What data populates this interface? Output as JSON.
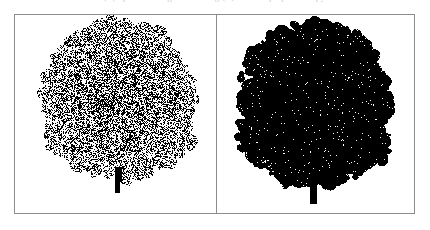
{
  "figure": {
    "caption_remnant": "(a) sparse foliage rendering          (b) dense opaque canopy",
    "frame_color": "#8c8c8c",
    "background_color": "#ffffff",
    "divider_x": 216
  },
  "panels": [
    {
      "id": "panel-left",
      "name": "left-tree-panel",
      "label": "",
      "tree": {
        "style": "halftone-dithered",
        "ink_color": "#000000",
        "paper_color": "#ffffff",
        "fill_ratio": 0.52,
        "canopy": {
          "center_x": 118,
          "top_y": 26,
          "bottom_y": 172,
          "left_x": 48,
          "right_x": 188,
          "width": 140,
          "height": 146
        },
        "trunk": {
          "center_x": 118,
          "top_y": 166,
          "bottom_y": 193,
          "width": 6
        },
        "seed": 1357
      }
    },
    {
      "id": "panel-right",
      "name": "right-tree-panel",
      "label": "",
      "tree": {
        "style": "solid-silhouette",
        "ink_color": "#000000",
        "paper_color": "#ffffff",
        "fill_ratio": 0.93,
        "canopy": {
          "center_x": 315,
          "top_y": 28,
          "bottom_y": 180,
          "left_x": 248,
          "right_x": 390,
          "width": 142,
          "height": 152
        },
        "trunk": {
          "center_x": 314,
          "top_y": 168,
          "bottom_y": 204,
          "width": 8
        },
        "seed": 8642
      }
    }
  ]
}
